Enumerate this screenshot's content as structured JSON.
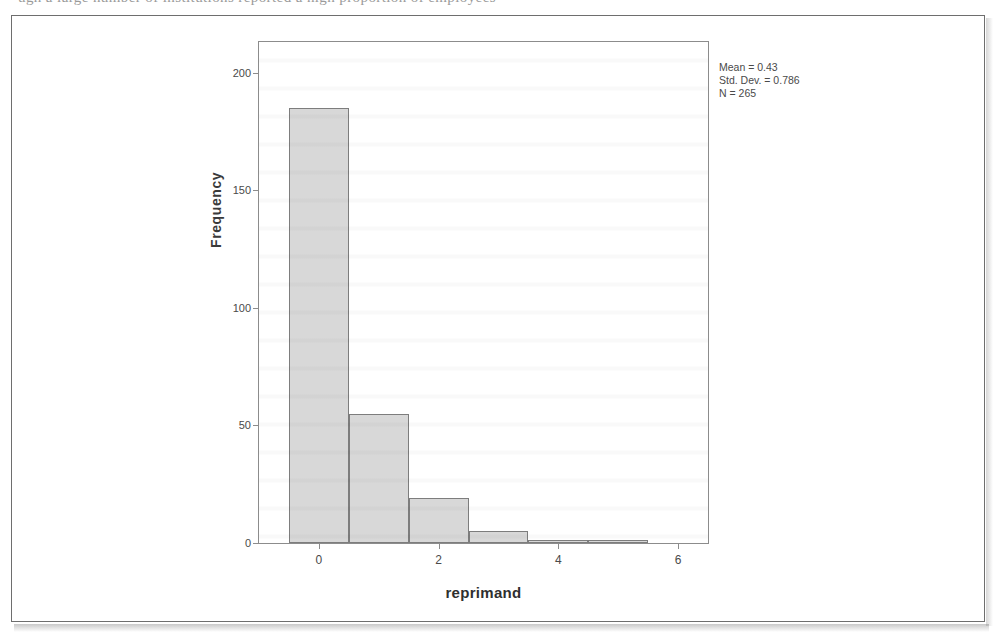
{
  "page": {
    "clipped_header_text": "ugh a large number of institutions reported a high proportion of employees"
  },
  "chart_data": {
    "type": "bar",
    "title": "",
    "subtitle": "",
    "xlabel": "reprimand",
    "ylabel": "Frequency",
    "grid": false,
    "legend": "none",
    "xlim": [
      -1.0,
      6.5
    ],
    "ylim": [
      0,
      213
    ],
    "xticks": [
      "0",
      "2",
      "4",
      "6"
    ],
    "xtick_values": [
      0,
      2,
      4,
      6
    ],
    "yticks": [
      "0",
      "50",
      "100",
      "150",
      "200"
    ],
    "ytick_values": [
      0,
      50,
      100,
      150,
      200
    ],
    "bin_width": 1,
    "categories": [
      "0",
      "1",
      "2",
      "3",
      "4",
      "5"
    ],
    "x": [
      0,
      1,
      2,
      3,
      4,
      5
    ],
    "values": [
      185,
      55,
      19,
      5,
      1,
      1
    ],
    "bar_fill_color": "#d8d8d8",
    "bar_edge_color": "#7d7d7d",
    "annotations": {
      "mean_label": "Mean = 0.43",
      "std_dev_label": "Std. Dev. = 0.786",
      "n_label": "N = 265",
      "mean": 0.43,
      "std_dev": 0.786,
      "n": 265
    }
  }
}
